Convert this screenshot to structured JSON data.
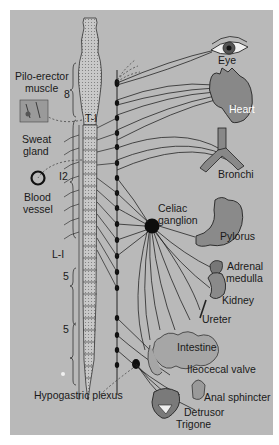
{
  "diagram": {
    "type": "anatomical-diagram",
    "colors": {
      "background": "#ffffff",
      "panel": "#b9b9b9",
      "ink": "#1a1a1a",
      "organ_fill": "#8a8a8a",
      "spine_fill": "#c9c9c9"
    },
    "spinal_labels": {
      "thoracic_count_upper": "8",
      "t1": "T-I",
      "thoracic_12": "I2",
      "l1": "L-I",
      "lumbar": "5",
      "sacral": "5"
    },
    "left_labels": {
      "pilo_erector_line1": "Pilo-erector",
      "pilo_erector_line2": "muscle",
      "sweat_line1": "Sweat",
      "sweat_line2": "gland",
      "blood_line1": "Blood",
      "blood_line2": "vessel",
      "hypogastric": "Hypogastric plexus"
    },
    "ganglion_labels": {
      "celiac_line1": "Celiac",
      "celiac_line2": "ganglion"
    },
    "organ_labels": {
      "eye": "Eye",
      "heart": "Heart",
      "bronchi": "Bronchi",
      "pylorus": "Pylorus",
      "adrenal_line1": "Adrenal",
      "adrenal_line2": "medulla",
      "kidney": "Kidney",
      "ureter": "Ureter",
      "intestine": "Intestine",
      "ileocecal": "Ileocecal valve",
      "anal": "Anal sphincter",
      "detrusor": "Detrusor",
      "trigone": "Trigone"
    }
  }
}
